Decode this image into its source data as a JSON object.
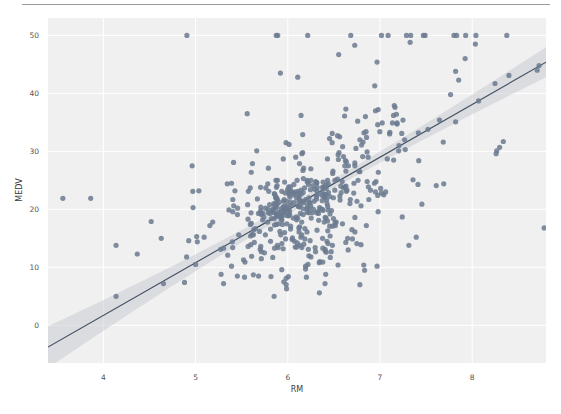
{
  "figure": {
    "separator_color": "#9a9a9a",
    "background_color": "#ffffff"
  },
  "chart_data": {
    "type": "scatter",
    "title": "",
    "xlabel": "RM",
    "ylabel": "MEDV",
    "xlim": [
      3.4,
      8.8
    ],
    "ylim": [
      -6.5,
      53
    ],
    "xticks": [
      4,
      5,
      6,
      7,
      8
    ],
    "xticklabels": [
      "4",
      "5",
      "6",
      "7",
      "8"
    ],
    "yticks": [
      0,
      10,
      20,
      30,
      40,
      50
    ],
    "yticklabels": [
      "0",
      "10",
      "20",
      "30",
      "40",
      "50"
    ],
    "grid": true,
    "grid_color": "#ffffff",
    "panel_color": "#f0f0f0",
    "legend": null,
    "point_color": "#6b7a8f",
    "point_radius": 2.6,
    "point_opacity": 0.85,
    "regression": {
      "type": "linear",
      "line_color": "#3d4a5c",
      "band_color": "#bfc4cb",
      "band_opacity": 0.45,
      "slope": 9.1,
      "intercept": -34.7,
      "ci_halfwidth_at_xmin": 3.6,
      "ci_halfwidth_at_center": 0.75,
      "ci_halfwidth_at_xmax": 2.6,
      "x_center": 6.28
    },
    "x": [
      6.575,
      6.421,
      7.185,
      6.998,
      7.147,
      6.43,
      6.012,
      6.172,
      5.631,
      6.004,
      6.377,
      6.009,
      5.889,
      5.949,
      6.096,
      5.834,
      5.935,
      5.99,
      5.456,
      5.727,
      5.57,
      5.965,
      6.142,
      5.813,
      5.924,
      5.599,
      5.813,
      6.047,
      6.495,
      6.674,
      5.713,
      6.072,
      5.95,
      5.701,
      6.096,
      5.933,
      5.841,
      5.85,
      5.966,
      6.595,
      7.024,
      6.77,
      6.169,
      6.211,
      6.069,
      5.682,
      5.786,
      6.03,
      5.399,
      5.602,
      5.963,
      6.115,
      6.511,
      5.998,
      5.888,
      7.249,
      6.383,
      6.816,
      6.145,
      5.927,
      5.741,
      5.966,
      6.456,
      6.762,
      7.104,
      6.29,
      5.787,
      5.878,
      5.594,
      5.885,
      6.417,
      5.961,
      6.065,
      6.245,
      6.273,
      6.286,
      6.279,
      6.14,
      6.232,
      5.874,
      6.727,
      6.619,
      6.302,
      6.167,
      6.389,
      6.63,
      6.015,
      6.121,
      7.007,
      7.079,
      6.417,
      6.405,
      6.442,
      6.211,
      6.249,
      6.625,
      6.163,
      8.069,
      7.82,
      7.416,
      6.727,
      6.781,
      6.405,
      6.137,
      6.167,
      5.851,
      5.836,
      6.127,
      6.474,
      6.229,
      6.195,
      6.715,
      5.913,
      6.092,
      6.254,
      5.928,
      6.176,
      6.021,
      5.872,
      5.731,
      5.87,
      6.004,
      5.961,
      5.856,
      5.879,
      5.986,
      5.613,
      5.693,
      6.431,
      5.637,
      6.458,
      6.326,
      6.372,
      5.822,
      5.757,
      6.335,
      5.942,
      6.454,
      5.857,
      6.151,
      6.174,
      5.019,
      5.403,
      5.468,
      4.903,
      6.13,
      5.628,
      4.926,
      5.186,
      5.597,
      6.122,
      5.404,
      5.012,
      5.709,
      6.129,
      6.152,
      5.272,
      6.943,
      6.066,
      6.51,
      6.25,
      7.489,
      7.802,
      8.375,
      5.854,
      6.101,
      7.929,
      5.877,
      6.319,
      6.402,
      5.875,
      5.88,
      5.572,
      6.416,
      5.859,
      6.546,
      6.02,
      6.315,
      6.86,
      6.98,
      7.765,
      6.144,
      7.155,
      6.563,
      5.604,
      6.153,
      7.831,
      6.782,
      6.556,
      7.185,
      6.951,
      6.739,
      7.178,
      6.8,
      6.604,
      7.287,
      7.107,
      7.274,
      6.975,
      7.135,
      6.162,
      7.61,
      7.853,
      8.034,
      5.891,
      6.326,
      5.783,
      6.064,
      5.344,
      5.96,
      5.404,
      5.807,
      6.375,
      5.412,
      6.182,
      5.888,
      6.642,
      5.951,
      6.373,
      6.951,
      6.164,
      6.879,
      6.618,
      8.266,
      8.725,
      8.04,
      7.163,
      7.686,
      6.552,
      5.981,
      7.412,
      8.337,
      8.247,
      6.726,
      6.086,
      6.631,
      7.358,
      6.481,
      6.606,
      6.897,
      6.095,
      6.358,
      6.393,
      5.593,
      5.605,
      6.108,
      6.226,
      6.433,
      6.718,
      6.487,
      6.438,
      6.957,
      8.259,
      6.108,
      5.876,
      7.454,
      8.704,
      7.333,
      6.842,
      7.203,
      7.52,
      8.398,
      7.327,
      7.206,
      5.56,
      7.014,
      8.297,
      7.47,
      5.92,
      5.856,
      6.24,
      6.538,
      7.691,
      6.758,
      6.854,
      7.267,
      6.826,
      6.482,
      6.812,
      7.82,
      6.968,
      7.645,
      7.923,
      7.088,
      6.453,
      6.23,
      6.209,
      6.315,
      6.565,
      6.861,
      7.148,
      6.63,
      6.127,
      6.009,
      6.678,
      6.549,
      5.79,
      6.345,
      7.041,
      6.871,
      6.59,
      6.495,
      6.982,
      7.236,
      6.616,
      7.42,
      6.849,
      6.635,
      5.972,
      4.973,
      6.122,
      6.023,
      6.266,
      6.567,
      5.705,
      5.914,
      5.782,
      6.382,
      6.113,
      6.426,
      6.376,
      6.041,
      5.708,
      6.415,
      6.431,
      6.312,
      6.083,
      5.868,
      6.333,
      6.144,
      5.706,
      6.031,
      6.316,
      6.31,
      6.037,
      5.869,
      5.895,
      6.059,
      5.985,
      5.968,
      7.241,
      6.54,
      6.696,
      6.874,
      6.014,
      5.898,
      6.516,
      6.635,
      6.939,
      6.49,
      6.579,
      5.884,
      6.728,
      5.663,
      5.936,
      6.212,
      6.395,
      6.127,
      6.112,
      6.398,
      6.251,
      5.362,
      5.803,
      8.78,
      3.561,
      4.963,
      3.863,
      4.97,
      6.683,
      7.016,
      6.216,
      5.875,
      4.906,
      4.138,
      7.313,
      6.649,
      6.794,
      6.38,
      6.223,
      6.968,
      6.545,
      5.536,
      5.52,
      4.368,
      5.277,
      4.652,
      5,
      4.88,
      5.39,
      5.713,
      6.051,
      5.036,
      6.193,
      5.887,
      6.471,
      6.405,
      5.747,
      5.453,
      5.852,
      5.987,
      6.343,
      6.404,
      5.349,
      5.531,
      5.683,
      4.138,
      5.608,
      5.617,
      6.852,
      6.657,
      4.628,
      5.155,
      4.519,
      6.434,
      6.782,
      5.304,
      5.957,
      6.824,
      6.411,
      6.006,
      5.648,
      6.103,
      5.565,
      5.896,
      5.837,
      6.202,
      6.193,
      6.38,
      6.348,
      6.833,
      6.425,
      6.436,
      6.208,
      6.629,
      6.461,
      6.152,
      5.935,
      5.627,
      5.818,
      6.406,
      6.219,
      6.485,
      5.854,
      6.459,
      6.341,
      6.251,
      6.185,
      6.417,
      6.749,
      6.655,
      6.297,
      7.393,
      6.728,
      6.525,
      5.976,
      5.936,
      6.301,
      6.081,
      6.701,
      6.376,
      6.317,
      6.513,
      6.209,
      5.759,
      5.952,
      6.003,
      5.926,
      5.713,
      6.167,
      6.229,
      6.437,
      6.98,
      5.427,
      6.162,
      6.484,
      5.304,
      6.185,
      6.229,
      6.242,
      6.75,
      7.061,
      5.762,
      5.871,
      6.312,
      6.114,
      5.905,
      5.454,
      5.414,
      5.093,
      5.983,
      5.983,
      5.707,
      5.926,
      5.67,
      5.39,
      5.794,
      6.019,
      5.569,
      6.027,
      6.593,
      6.12,
      6.976,
      6.794,
      6.03
    ],
    "y": [
      24,
      21.6,
      34.7,
      33.4,
      36.2,
      28.7,
      22.9,
      27.1,
      16.5,
      18.9,
      15,
      18.9,
      21.7,
      20.4,
      18.2,
      19.9,
      23.1,
      17.5,
      20.2,
      18.2,
      13.6,
      19.6,
      15.2,
      14.5,
      15.6,
      13.9,
      16.6,
      14.8,
      18.4,
      21,
      12.7,
      14.5,
      13.2,
      13.1,
      13.5,
      18.9,
      20,
      21,
      24.7,
      30.8,
      34.9,
      26.6,
      25.3,
      24.7,
      21.2,
      19.3,
      20,
      16.6,
      14.4,
      19.4,
      19.7,
      20.5,
      25,
      23.4,
      18.9,
      35.4,
      24.7,
      31.6,
      23.3,
      19.6,
      18.7,
      16,
      22.2,
      25,
      33,
      23.5,
      19.4,
      22,
      17.4,
      20.9,
      24.2,
      21.7,
      22.8,
      23.4,
      24.1,
      21.4,
      20,
      20.8,
      21.2,
      20.3,
      28,
      23.9,
      24.8,
      22.9,
      23.9,
      26.6,
      22.5,
      22.2,
      23.6,
      28.7,
      22.6,
      22,
      22.9,
      25,
      20.6,
      28.4,
      21.4,
      38.7,
      43.8,
      33.2,
      27.5,
      26.5,
      18.6,
      19.3,
      20.1,
      19.5,
      19.5,
      20.4,
      19.8,
      19.4,
      21.7,
      22.8,
      18.8,
      18.7,
      18.5,
      18.3,
      21.2,
      19.2,
      20.4,
      19.3,
      22,
      20.3,
      20.5,
      17.3,
      18.8,
      21.4,
      15.7,
      16.2,
      18,
      14.3,
      19.2,
      19.6,
      23,
      18.4,
      15.6,
      18.1,
      17.4,
      17.1,
      13.3,
      17.8,
      14,
      14.4,
      13.4,
      15.6,
      11.8,
      13.8,
      15.6,
      14.6,
      17.8,
      15.4,
      21.5,
      19.6,
      15.3,
      19.4,
      17,
      15.6,
      13.1,
      41.3,
      24.3,
      23.3,
      27,
      50,
      50,
      50,
      22.7,
      25,
      50,
      23.8,
      23.8,
      22.3,
      17.4,
      19.1,
      23.1,
      23.6,
      22.6,
      29.4,
      23.2,
      24.6,
      29.9,
      37.2,
      39.8,
      36.2,
      37.9,
      32.5,
      26.4,
      29.6,
      50,
      32,
      29.8,
      34.9,
      37,
      30.5,
      36.4,
      31.1,
      29.1,
      50,
      33.3,
      30.3,
      34.6,
      34.9,
      32.9,
      24.1,
      42.3,
      48.5,
      50,
      22.6,
      24.4,
      22.5,
      24.4,
      20,
      21.7,
      19.3,
      22.4,
      28.1,
      23.7,
      25,
      23.3,
      28.7,
      21.5,
      23,
      26.7,
      21.7,
      27.5,
      30.1,
      44.8,
      50,
      37.6,
      31.6,
      46.7,
      31.5,
      24.3,
      31.7,
      41.7,
      48.3,
      29,
      24,
      25.1,
      31.5,
      23.7,
      23.3,
      22,
      20.1,
      22.2,
      23.7,
      17.6,
      18.5,
      24.3,
      20.5,
      24.5,
      26.2,
      24.4,
      24.8,
      29.6,
      42.8,
      21.9,
      20.9,
      44,
      50,
      36,
      30.1,
      33.8,
      43.1,
      48.8,
      31,
      36.5,
      22.8,
      30.7,
      50,
      43.5,
      20.7,
      21.1,
      25.2,
      24.4,
      35.2,
      32.4,
      32,
      33.2,
      33.1,
      29.1,
      35.1,
      45.4,
      35.4,
      46,
      50,
      32.2,
      22,
      20.1,
      23.2,
      22.3,
      24.8,
      28.5,
      37.3,
      27.9,
      23.9,
      21.7,
      28.6,
      27.1,
      20.3,
      22.5,
      29,
      24.8,
      22,
      26.4,
      33.1,
      36.1,
      28.4,
      33.4,
      28.2,
      22.8,
      20.3,
      16.1,
      22.1,
      19.4,
      21.6,
      23.8,
      16.2,
      17.8,
      19.8,
      23.1,
      21,
      23.8,
      23.1,
      20.4,
      18.5,
      25,
      24.6,
      23,
      22.2,
      19.3,
      22.6,
      19.8,
      17.1,
      19.4,
      22.2,
      20.7,
      21.1,
      19.5,
      18.5,
      20.6,
      19,
      18.7,
      32.7,
      16.5,
      23.9,
      31.2,
      17.5,
      17.2,
      23.1,
      24.5,
      26.6,
      22.9,
      24.1,
      18.6,
      30.1,
      18.2,
      20.6,
      17.8,
      21.7,
      22.7,
      22.6,
      25,
      19.9,
      20.8,
      16.8,
      21.9,
      27.5,
      21.9,
      23.1,
      50,
      50,
      50,
      50,
      50,
      13.8,
      13.8,
      15,
      13.9,
      13.3,
      13.1,
      10.2,
      10.4,
      10.9,
      11.3,
      12.3,
      8.8,
      7.2,
      10.5,
      7.4,
      10.2,
      11.5,
      15.1,
      23.2,
      9.7,
      13.8,
      12.7,
      13.1,
      12.5,
      8.5,
      5,
      6.3,
      5.6,
      7.2,
      12.1,
      8.3,
      8.5,
      5,
      11.9,
      27.9,
      17.2,
      27.5,
      15,
      17.2,
      17.9,
      16.3,
      7,
      7.2,
      7.5,
      10.4,
      8.8,
      8.4,
      16.7,
      14.2,
      20.8,
      13.4,
      11.7,
      8.3,
      10.2,
      10.9,
      11,
      9.5,
      14.5,
      14.1,
      16.1,
      14.3,
      11.7,
      13.4,
      9.6,
      8.7,
      8.4,
      12.8,
      10.5,
      17.1,
      18.4,
      15.4,
      10.8,
      11.8,
      14.9,
      12.6,
      14.1,
      13,
      13.4,
      15.2,
      16.1,
      17.8,
      14.9,
      14.1,
      12.7,
      13.5,
      14.9,
      20,
      16.4,
      17.7,
      19.5,
      20.2,
      21.4,
      19.9,
      19,
      19.1,
      19.1,
      20.1,
      19.9,
      19.6,
      23.2,
      29.8,
      13.8,
      13.3,
      16.7,
      12,
      14.6,
      21.4,
      23,
      23.7,
      25,
      21.8,
      20.6,
      21.2,
      19.1,
      20.6,
      15.2,
      7,
      8.1,
      13.6,
      20.1,
      21.8,
      24.5,
      23.1,
      19.7,
      18.3,
      21.2,
      17.5,
      16.8,
      22.4,
      20.6,
      23.9,
      22,
      11.9
    ]
  },
  "axis": {
    "ylabel_text": "MEDV",
    "xlabel_text": "RM"
  }
}
